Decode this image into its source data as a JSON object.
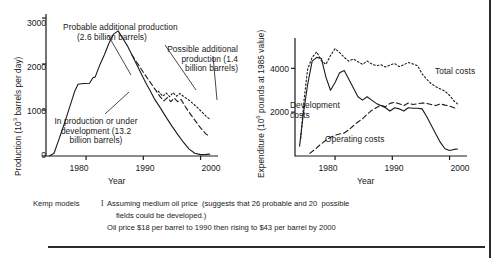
{
  "figure": {
    "caption": {
      "model_label": "Kemp models",
      "numeral": "I",
      "line1": "Assuming medium oil price  (suggests that 26 probable and 20  possible",
      "line2": "fields could be developed.)",
      "line3": "Oil price $18 per barrel to 1990 then rising to $43 per barrel by 2000"
    },
    "colors": {
      "ink": "#1a1a1a",
      "background": "#ffffff"
    }
  },
  "chart_data": [
    {
      "type": "line",
      "panel": "left",
      "title": "",
      "xlabel": "Year",
      "ylabel": "Production (10³ barrels per day)",
      "ylabel_text": "Production (10",
      "ylabel_sup": "3",
      "ylabel_tail": " barrels per day)",
      "xlim": [
        1973,
        2002
      ],
      "ylim": [
        0,
        3000
      ],
      "xticks": [
        1980,
        1990,
        2000
      ],
      "xticklabels": [
        "1980",
        "1990",
        "2000"
      ],
      "yticks": [
        0,
        1000,
        2000,
        3000
      ],
      "yticklabels": [
        "0",
        "1000",
        "2000",
        "3000"
      ],
      "grid": false,
      "legend": "annotations",
      "annotations": [
        {
          "name": "probable-additional-production",
          "lines": [
            "Probable additional production",
            "(2.6 billion barrels)"
          ],
          "style": "dashed"
        },
        {
          "name": "possible-additional-production",
          "lines": [
            "Possible additional",
            "production (1.4",
            "billion barrels)"
          ],
          "style": "dotted"
        },
        {
          "name": "in-production-or-under-development",
          "lines": [
            "In production or under",
            "development (13.2",
            "billion barrels)"
          ],
          "style": "solid"
        }
      ],
      "series": [
        {
          "name": "In production or under development",
          "style": "solid",
          "x": [
            1973.6,
            1974.4,
            1975.2,
            1976.2,
            1977.2,
            1978.0,
            1978.6,
            1979.2,
            1979.8,
            1980.6,
            1981.2,
            1981.6,
            1982.4,
            1983.2,
            1984.0,
            1984.8,
            1985.6,
            1986.4,
            1987.2,
            1988.0,
            1988.8,
            1989.6,
            1990.4,
            1991.2,
            1992.0,
            1993.0,
            1994.0,
            1995.0,
            1996.0,
            1997.0,
            1998.0,
            1999.0,
            2000.0,
            2001.0,
            2001.6
          ],
          "y": [
            0,
            60,
            340,
            700,
            1090,
            1400,
            1560,
            1570,
            1575,
            1580,
            1700,
            1720,
            1980,
            2200,
            2450,
            2650,
            2720,
            2560,
            2400,
            2200,
            2000,
            1800,
            1600,
            1420,
            1230,
            1040,
            840,
            650,
            470,
            300,
            150,
            60,
            30,
            35,
            40
          ]
        },
        {
          "name": "Probable additional production",
          "style": "dashed",
          "x": [
            1988.0,
            1989.0,
            1990.0,
            1991.0,
            1992.0,
            1993.0,
            1993.6,
            1994.2,
            1994.8,
            1995.4,
            1996.0,
            1996.6,
            1997.2,
            1998.0,
            1999.0,
            2000.0,
            2001.0,
            2001.6
          ],
          "y": [
            2200,
            2010,
            1820,
            1640,
            1460,
            1280,
            1200,
            1270,
            1180,
            1260,
            1180,
            1230,
            1100,
            950,
            780,
            610,
            470,
            430
          ]
        },
        {
          "name": "Possible additional production",
          "style": "dotted",
          "x": [
            1992.6,
            1993.4,
            1994.0,
            1994.6,
            1995.2,
            1995.8,
            1996.4,
            1997.0,
            1997.8,
            1998.6,
            1999.4,
            2000.2,
            2001.0,
            2001.6
          ],
          "y": [
            1410,
            1300,
            1370,
            1290,
            1380,
            1300,
            1360,
            1300,
            1230,
            1150,
            1060,
            960,
            860,
            800
          ]
        }
      ]
    },
    {
      "type": "line",
      "panel": "right",
      "title": "",
      "xlabel": "Year",
      "ylabel": "Expenditure (10⁶ pounds at 1985 value)",
      "ylabel_text": "Expenditure (10",
      "ylabel_sup": "6",
      "ylabel_tail": " pounds at 1985 value)",
      "xlim": [
        1973,
        2002
      ],
      "ylim": [
        0,
        5200
      ],
      "xticks": [
        1980,
        1990,
        2000
      ],
      "xticklabels": [
        "1980",
        "1990",
        "2000"
      ],
      "yticks": [
        2000,
        4000
      ],
      "yticklabels": [
        "2000",
        "4000"
      ],
      "grid": false,
      "legend": "inline-labels",
      "annotations": [
        {
          "name": "total-costs-label",
          "lines": [
            "Total costs"
          ],
          "style": "dotted"
        },
        {
          "name": "development-costs-label",
          "lines": [
            "Development",
            "costs"
          ],
          "style": "solid"
        },
        {
          "name": "operating-costs-label",
          "lines": [
            "Operating costs"
          ],
          "style": "dashed"
        }
      ],
      "series": [
        {
          "name": "Total costs",
          "style": "dotted",
          "x": [
            1974.0,
            1974.6,
            1975.2,
            1976.0,
            1976.8,
            1977.6,
            1978.4,
            1979.2,
            1980.0,
            1980.8,
            1981.6,
            1982.4,
            1983.2,
            1984.0,
            1984.8,
            1985.6,
            1986.4,
            1987.2,
            1988.0,
            1988.8,
            1989.6,
            1990.4,
            1991.2,
            1992.0,
            1992.8,
            1993.6,
            1994.4,
            1995.2,
            1996.0,
            1996.8,
            1997.6,
            1998.4,
            1999.2,
            2000.0,
            2000.8,
            2001.4
          ],
          "y": [
            800,
            2600,
            3950,
            4500,
            4750,
            4350,
            4180,
            4580,
            4900,
            4720,
            4500,
            4330,
            4430,
            4300,
            4180,
            4330,
            4200,
            4120,
            4160,
            4060,
            4150,
            4220,
            4080,
            4160,
            4270,
            4200,
            4120,
            3750,
            3500,
            3300,
            3160,
            3060,
            2960,
            2760,
            2500,
            2380
          ]
        },
        {
          "name": "Development costs",
          "style": "solid",
          "x": [
            1973.8,
            1974.4,
            1975.2,
            1976.0,
            1976.8,
            1977.6,
            1978.4,
            1979.2,
            1980.0,
            1980.8,
            1981.6,
            1982.4,
            1983.2,
            1984.0,
            1984.8,
            1985.6,
            1986.4,
            1987.2,
            1988.0,
            1988.8,
            1989.6,
            1990.4,
            1991.2,
            1992.0,
            1992.8,
            1993.6,
            1994.4,
            1995.2,
            1996.0,
            1996.8,
            1997.6,
            1998.4,
            1999.2,
            2000.0,
            2000.8,
            2001.4
          ],
          "y": [
            450,
            1800,
            3250,
            4330,
            4500,
            4450,
            3600,
            3000,
            3350,
            3800,
            3900,
            3500,
            3100,
            2700,
            2550,
            2700,
            2550,
            2400,
            2300,
            2200,
            2050,
            2200,
            2150,
            2050,
            2200,
            2180,
            2180,
            2150,
            1800,
            1400,
            1000,
            620,
            330,
            250,
            300,
            320
          ]
        },
        {
          "name": "Operating costs",
          "style": "dashed",
          "x": [
            1975.6,
            1976.6,
            1977.6,
            1978.4,
            1979.2,
            1980.0,
            1980.8,
            1981.6,
            1982.4,
            1983.2,
            1984.0,
            1984.8,
            1985.6,
            1986.4,
            1987.2,
            1988.0,
            1988.8,
            1989.6,
            1990.4,
            1991.2,
            1992.0,
            1992.8,
            1993.6,
            1994.4,
            1995.2,
            1996.0,
            1996.8,
            1997.6,
            1998.4,
            1999.2,
            2000.0,
            2000.8,
            2001.4
          ],
          "y": [
            120,
            330,
            560,
            720,
            850,
            950,
            1000,
            1050,
            1200,
            1380,
            1550,
            1700,
            1900,
            2080,
            2200,
            2320,
            2250,
            2400,
            2450,
            2380,
            2300,
            2420,
            2350,
            2380,
            2420,
            2400,
            2350,
            2300,
            2380,
            2320,
            2280,
            2200,
            2150
          ]
        }
      ]
    }
  ]
}
